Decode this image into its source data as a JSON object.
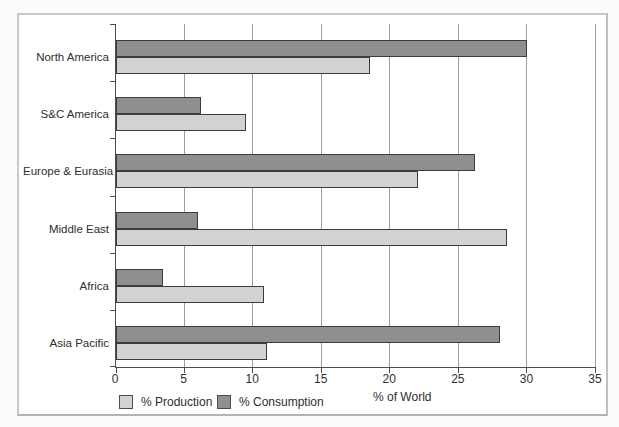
{
  "figure": {
    "background_color": "#ffffff",
    "frame_border_color": "#c9c9c9",
    "axis_color": "#4d4d4d",
    "gridline_color": "#9e9e9e",
    "text_color": "#2e2e2e"
  },
  "chart_data": {
    "type": "bar",
    "orientation": "horizontal",
    "title": "",
    "xlabel": "% of World",
    "ylabel": "",
    "xlim": [
      0,
      35
    ],
    "xticks": [
      0,
      5,
      10,
      15,
      20,
      25,
      30,
      35
    ],
    "grid": true,
    "legend_position": "bottom",
    "categories": [
      "North America",
      "S&C America",
      "Europe & Eurasia",
      "Middle East",
      "Africa",
      "Asia Pacific"
    ],
    "series": [
      {
        "name": "% Production",
        "color": "#d2d2d2",
        "values": [
          18.5,
          9.5,
          22,
          28.5,
          10.8,
          11
        ]
      },
      {
        "name": "% Consumption",
        "color": "#8f8f8f",
        "values": [
          30,
          6.2,
          26.2,
          6,
          3.4,
          28
        ]
      }
    ]
  }
}
